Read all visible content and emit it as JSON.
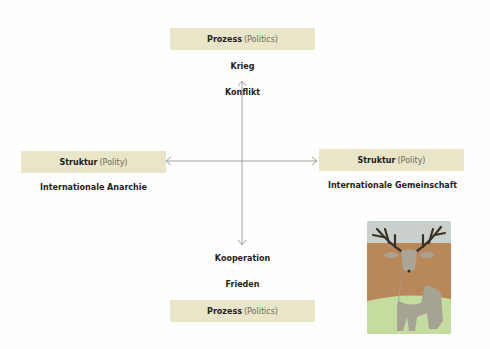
{
  "top_box": {
    "bold": "Prozess",
    "sub": "(Politics)"
  },
  "top_labels": {
    "outer": "Krieg",
    "inner": "Konflikt"
  },
  "left_box": {
    "bold": "Struktur",
    "sub": "(Polity)"
  },
  "left_label": "Internationale Anarchie",
  "right_box": {
    "bold": "Struktur",
    "sub": "(Polity)"
  },
  "right_label": "Internationale Gemeinschaft",
  "bottom_labels": {
    "inner": "Kooperation",
    "outer": "Frieden"
  },
  "bottom_box": {
    "bold": "Prozess",
    "sub": "(Politics)"
  },
  "image": {
    "subject": "deer-illustration"
  },
  "colors": {
    "box_bg": "#e8e5c8",
    "axis": "#8a8a8a"
  }
}
